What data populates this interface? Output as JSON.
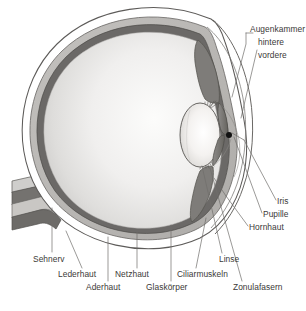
{
  "figure": {
    "language": "de",
    "type": "anatomical-cross-section",
    "background_color": "#ffffff",
    "label_color": "#3b3a38",
    "leader_line_color": "#6e6c6a"
  },
  "palette": {
    "sclera_fill": "#ffffff",
    "sclera_stroke": "#5d5b59",
    "choroid_fill": "#b9b7b4",
    "retina_fill": "#6b6967",
    "vitreous_light": "#fbfbfb",
    "vitreous_mid": "#ebeae9",
    "vitreous_dark": "#d2d1cf",
    "lens_light": "#fdfdfc",
    "lens_mid": "#eceae7",
    "iris_fill": "#7c7a78",
    "ciliary_fill": "#8a8886",
    "pupil_fill": "#111111",
    "nerve_light": "#cfcecc",
    "nerve_dark": "#5f5d5b"
  },
  "labels": {
    "augenkammer": "Augenkammer",
    "hintere": "hintere",
    "vordere": "vordere",
    "iris": "Iris",
    "pupille": "Pupille",
    "hornhaut": "Hornhaut",
    "zonulafasern": "Zonulafasern",
    "linse": "Linse",
    "ciliarmuskeln": "Ciliarmuskeln",
    "glaskoerper": "Glaskörper",
    "netzhaut": "Netzhaut",
    "aderhaut": "Aderhaut",
    "lederhaut": "Lederhaut",
    "sehnerv": "Sehnerv"
  },
  "structures": [
    {
      "id": "sehnerv",
      "label": "Sehnerv",
      "side": "left",
      "description": "Optic nerve, banded bundle exiting the posterior pole"
    },
    {
      "id": "lederhaut",
      "label": "Lederhaut",
      "side": "bottom-left",
      "description": "Sclera, outermost white layer"
    },
    {
      "id": "aderhaut",
      "label": "Aderhaut",
      "side": "bottom-left",
      "description": "Choroid, mid grey vascular layer"
    },
    {
      "id": "netzhaut",
      "label": "Netzhaut",
      "side": "bottom",
      "description": "Retina, innermost dark grey layer"
    },
    {
      "id": "glaskoerper",
      "label": "Glaskörper",
      "side": "bottom",
      "description": "Vitreous body filling the globe"
    },
    {
      "id": "ciliarmuskeln",
      "label": "Ciliarmuskeln",
      "side": "bottom",
      "description": "Ciliary muscles around the lens equator"
    },
    {
      "id": "linse",
      "label": "Linse",
      "side": "bottom",
      "description": "Crystalline lens"
    },
    {
      "id": "zonulafasern",
      "label": "Zonulafasern",
      "side": "bottom-right",
      "description": "Zonular fibres suspending the lens"
    },
    {
      "id": "hornhaut",
      "label": "Hornhaut",
      "side": "right",
      "description": "Cornea, transparent anterior dome"
    },
    {
      "id": "pupille",
      "label": "Pupille",
      "side": "right",
      "description": "Pupil aperture in the iris"
    },
    {
      "id": "iris",
      "label": "Iris",
      "side": "right",
      "description": "Iris diaphragm"
    },
    {
      "id": "augenkammer",
      "label": "Augenkammer",
      "side": "top-right",
      "description": "Chambers of the eye",
      "sub": [
        {
          "id": "hintere",
          "label": "hintere",
          "description": "Posterior chamber, behind the iris"
        },
        {
          "id": "vordere",
          "label": "vordere",
          "description": "Anterior chamber, between cornea and iris"
        }
      ]
    }
  ]
}
